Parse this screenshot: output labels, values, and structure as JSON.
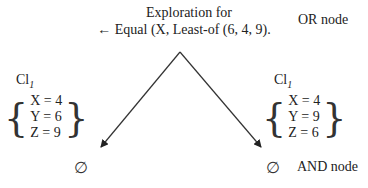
{
  "diagram": {
    "title_line1": "Exploration for",
    "title_line2": "← Equal (X, Least-of (6, 4, 9).",
    "or_node_label": "OR node",
    "and_node_label": "AND node",
    "left_branch": {
      "cl_label": "Cl",
      "cl_sub": "1",
      "lines": [
        "X = 4",
        "Y = 6",
        "Z = 9"
      ],
      "result": "∅"
    },
    "right_branch": {
      "cl_label": "Cl",
      "cl_sub": "1",
      "lines": [
        "X = 4",
        "Y = 9",
        "Z = 6"
      ],
      "result": "∅"
    },
    "brace_left": "{",
    "brace_right": "}",
    "colors": {
      "text": "#222222",
      "arrow": "#333333",
      "background": "#ffffff"
    }
  }
}
